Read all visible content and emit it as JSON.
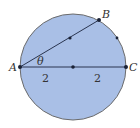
{
  "diagram": {
    "circle": {
      "fill": "#a9bfe6",
      "stroke": "#6b6b6b"
    },
    "points": {
      "A": {
        "label": "A"
      },
      "B": {
        "label": "B"
      },
      "C": {
        "label": "C"
      }
    },
    "angle_label": "θ",
    "segment_labels": {
      "left": "2",
      "right": "2"
    },
    "line_color": "#2a3550"
  }
}
